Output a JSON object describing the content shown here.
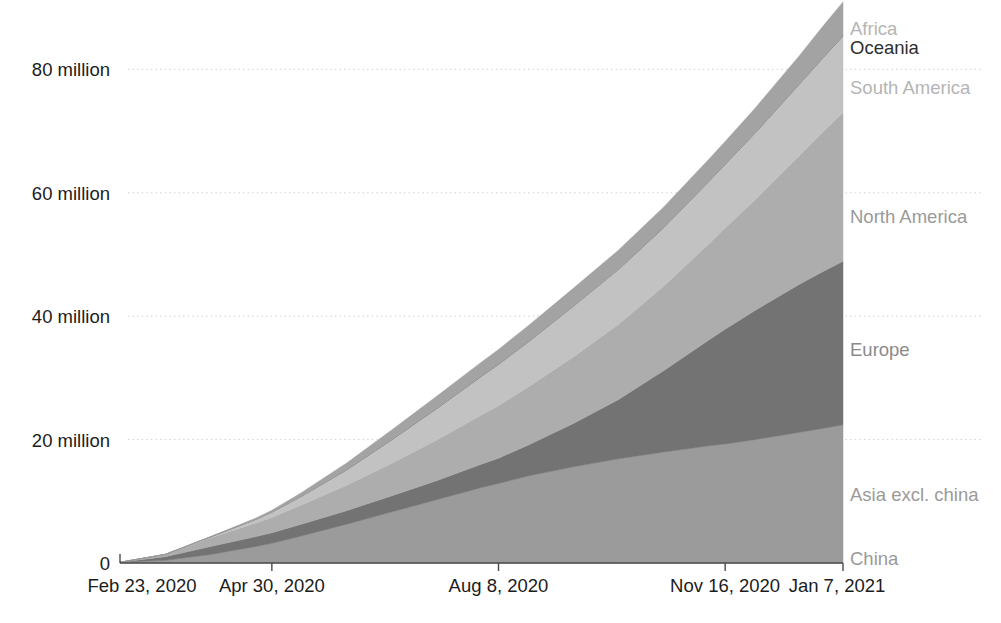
{
  "chart_data": {
    "type": "area",
    "stacked": true,
    "title": "",
    "subtitle": "",
    "xlabel": "",
    "ylabel": "",
    "grid": true,
    "legend_position": "right-inline-labels",
    "ylim": [
      0,
      88
    ],
    "y_unit": "million",
    "y_ticks": [
      {
        "value": 0,
        "label": "0"
      },
      {
        "value": 20,
        "label": "20 million"
      },
      {
        "value": 40,
        "label": "40 million"
      },
      {
        "value": 60,
        "label": "60 million"
      },
      {
        "value": 80,
        "label": "80 million"
      }
    ],
    "x_ticks": [
      {
        "index": 0,
        "label": "Feb 23, 2020"
      },
      {
        "index": 67,
        "label": "Apr 30, 2020"
      },
      {
        "index": 167,
        "label": "Aug 8, 2020"
      },
      {
        "index": 267,
        "label": "Nov 16, 2020"
      },
      {
        "index": 319,
        "label": "Jan 7, 2021"
      }
    ],
    "x_domain": [
      "Feb 23, 2020",
      "Jan 7, 2021"
    ],
    "x": [
      0,
      20,
      40,
      60,
      67,
      80,
      100,
      120,
      140,
      160,
      167,
      180,
      200,
      220,
      240,
      260,
      267,
      280,
      300,
      310,
      319
    ],
    "series": [
      {
        "name": "China",
        "color": "#8d8d8d",
        "label_color": "#9a9a9a",
        "label_y_value": 0.6,
        "values": [
          0.077,
          0.081,
          0.083,
          0.084,
          0.084,
          0.085,
          0.085,
          0.086,
          0.087,
          0.088,
          0.089,
          0.089,
          0.09,
          0.091,
          0.092,
          0.093,
          0.093,
          0.094,
          0.096,
          0.096,
          0.097
        ]
      },
      {
        "name": "Asia excl. china",
        "color": "#9b9b9b",
        "label_color": "#9a9a9a",
        "label_y_value": 11.0,
        "values": [
          0.04,
          0.35,
          1.3,
          2.6,
          3.1,
          4.3,
          6.2,
          8.2,
          10.2,
          12.2,
          12.8,
          14.0,
          15.5,
          16.8,
          17.9,
          18.9,
          19.2,
          19.9,
          21.1,
          21.7,
          22.3
        ]
      },
      {
        "name": "Europe",
        "color": "#737373",
        "label_color": "#8a8a8a",
        "label_y_value": 34.5,
        "values": [
          0.01,
          0.6,
          1.3,
          1.6,
          1.7,
          1.9,
          2.2,
          2.6,
          3.1,
          3.8,
          4.1,
          5.0,
          7.0,
          9.6,
          13.2,
          17.2,
          18.6,
          20.9,
          24.0,
          25.4,
          26.5
        ]
      },
      {
        "name": "North America",
        "color": "#adadad",
        "label_color": "#9a9a9a",
        "label_y_value": 56.0,
        "values": [
          0.0,
          0.35,
          1.4,
          2.2,
          2.5,
          3.1,
          4.1,
          5.3,
          6.6,
          8.0,
          8.5,
          9.4,
          10.8,
          12.2,
          13.7,
          15.6,
          16.4,
          17.9,
          20.9,
          22.6,
          24.1
        ]
      },
      {
        "name": "South America",
        "color": "#c2c2c2",
        "label_color": "#b5b5b5",
        "label_y_value": 77.0,
        "values": [
          0.0,
          0.02,
          0.15,
          0.6,
          0.85,
          1.4,
          2.5,
          3.8,
          5.1,
          6.3,
          6.7,
          7.3,
          8.2,
          8.9,
          9.5,
          10.1,
          10.3,
          10.8,
          11.6,
          12.0,
          12.4
        ]
      },
      {
        "name": "Oceania",
        "color": "#6a6a6a",
        "label_color": "#2e2e2e",
        "label_y_value": 83.5,
        "values": [
          0.0,
          0.006,
          0.008,
          0.008,
          0.008,
          0.009,
          0.012,
          0.017,
          0.022,
          0.026,
          0.027,
          0.028,
          0.029,
          0.03,
          0.03,
          0.031,
          0.031,
          0.032,
          0.032,
          0.033,
          0.033
        ]
      },
      {
        "name": "Africa",
        "color": "#a3a3a3",
        "label_color": "#b5b5b5",
        "label_y_value": 86.5,
        "values": [
          0.0,
          0.01,
          0.05,
          0.2,
          0.3,
          0.6,
          1.1,
          1.6,
          2.0,
          2.3,
          2.4,
          2.6,
          2.9,
          3.1,
          3.3,
          3.6,
          3.7,
          4.0,
          4.6,
          5.1,
          5.5
        ]
      }
    ]
  },
  "axis": {
    "y_labels": [
      "80 million",
      "60 million",
      "40 million",
      "20 million"
    ],
    "zero_label": "0",
    "x_labels": [
      "Feb 23, 2020",
      "Apr 30, 2020",
      "Aug 8, 2020",
      "Nov 16, 2020",
      "Jan 7, 2021"
    ]
  },
  "series_labels": [
    {
      "name": "Africa"
    },
    {
      "name": "Oceania"
    },
    {
      "name": "South America"
    },
    {
      "name": "North America"
    },
    {
      "name": "Europe"
    },
    {
      "name": "Asia excl. china"
    },
    {
      "name": "China"
    }
  ],
  "colors": {
    "background": "#ffffff",
    "axis": "#4a4a4a",
    "grid": "#cfcfcf",
    "text": "#1c1c1c",
    "muted_text": "#9a9a9a"
  }
}
